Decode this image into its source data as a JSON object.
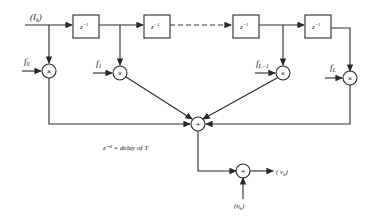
{
  "diagram": {
    "input_label": "(I",
    "input_sub": "k",
    "input_close": ")",
    "delay_label": "z",
    "delay_exp": "−1",
    "taps": [
      {
        "label": "f",
        "sub": "0"
      },
      {
        "label": "f",
        "sub": "1"
      },
      {
        "label": "f",
        "sub": "L−1"
      },
      {
        "label": "f",
        "sub": "L"
      }
    ],
    "multiplier_symbol": "×",
    "adder_symbol": "+",
    "legend": "z⁻¹ = delay of T",
    "noise_label": "(η",
    "noise_sub": "k",
    "noise_close": ")",
    "output_label": "( v",
    "output_sub": "k",
    "output_close": ")"
  }
}
